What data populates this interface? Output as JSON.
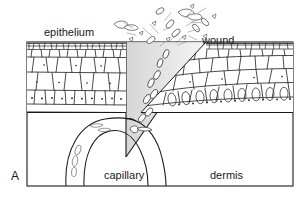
{
  "figure": {
    "panel_letter": "A",
    "caption_labels": {
      "epithelium": "epithelium",
      "wound": "wound",
      "capillary": "capillary",
      "dermis": "dermis"
    }
  },
  "colors": {
    "ink": "#1a1a1a",
    "background": "#ffffff",
    "wound_fill": "#d9d9d9",
    "cell_outline": "#2b2b2b",
    "frame": "#1a1a1a"
  },
  "structures": [
    {
      "name": "epithelium-left",
      "label": "epithelium"
    },
    {
      "name": "epithelium-right",
      "label": "wound"
    },
    {
      "name": "dermis",
      "label": "dermis"
    },
    {
      "name": "capillary-loop",
      "label": "capillary"
    },
    {
      "name": "wound-wedge",
      "label": "wound"
    },
    {
      "name": "blood-spray",
      "label": ""
    }
  ]
}
